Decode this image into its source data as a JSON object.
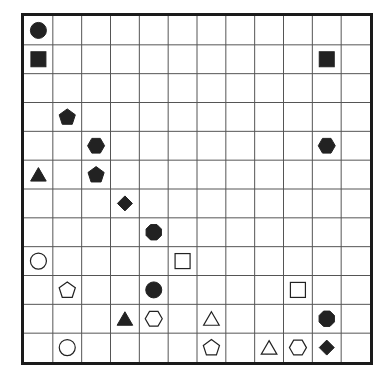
{
  "board": {
    "rows": 12,
    "cols": 12,
    "line_color": "#555555",
    "border_color": "#1a1a1a",
    "piece_color": "#222222"
  },
  "pieces": [
    {
      "row": 0,
      "col": 0,
      "shape": "circle",
      "fill": "filled"
    },
    {
      "row": 1,
      "col": 0,
      "shape": "square",
      "fill": "filled"
    },
    {
      "row": 1,
      "col": 10,
      "shape": "square",
      "fill": "filled"
    },
    {
      "row": 3,
      "col": 1,
      "shape": "pentagon",
      "fill": "filled"
    },
    {
      "row": 4,
      "col": 2,
      "shape": "hexagon",
      "fill": "filled"
    },
    {
      "row": 4,
      "col": 10,
      "shape": "hexagon",
      "fill": "filled"
    },
    {
      "row": 5,
      "col": 0,
      "shape": "triangle",
      "fill": "filled"
    },
    {
      "row": 5,
      "col": 2,
      "shape": "pentagon",
      "fill": "filled"
    },
    {
      "row": 6,
      "col": 3,
      "shape": "diamond",
      "fill": "filled"
    },
    {
      "row": 7,
      "col": 4,
      "shape": "octagon",
      "fill": "filled"
    },
    {
      "row": 8,
      "col": 0,
      "shape": "circle",
      "fill": "open"
    },
    {
      "row": 8,
      "col": 5,
      "shape": "square",
      "fill": "open"
    },
    {
      "row": 9,
      "col": 1,
      "shape": "pentagon",
      "fill": "open"
    },
    {
      "row": 9,
      "col": 4,
      "shape": "circle",
      "fill": "filled"
    },
    {
      "row": 9,
      "col": 9,
      "shape": "square",
      "fill": "open"
    },
    {
      "row": 10,
      "col": 3,
      "shape": "triangle",
      "fill": "filled"
    },
    {
      "row": 10,
      "col": 4,
      "shape": "hexagon",
      "fill": "open"
    },
    {
      "row": 10,
      "col": 6,
      "shape": "triangle",
      "fill": "open"
    },
    {
      "row": 10,
      "col": 10,
      "shape": "octagon",
      "fill": "filled"
    },
    {
      "row": 11,
      "col": 1,
      "shape": "circle",
      "fill": "open"
    },
    {
      "row": 11,
      "col": 6,
      "shape": "pentagon",
      "fill": "open"
    },
    {
      "row": 11,
      "col": 8,
      "shape": "triangle",
      "fill": "open"
    },
    {
      "row": 11,
      "col": 9,
      "shape": "hexagon",
      "fill": "open"
    },
    {
      "row": 11,
      "col": 10,
      "shape": "diamond",
      "fill": "filled"
    }
  ]
}
